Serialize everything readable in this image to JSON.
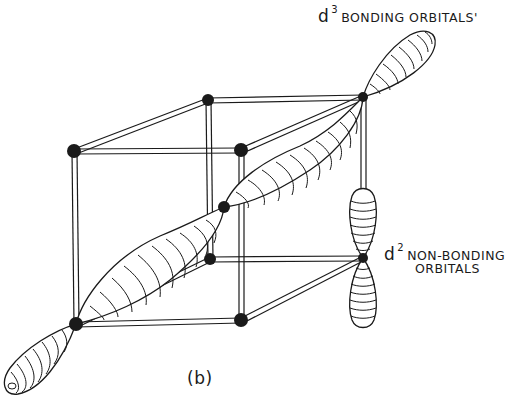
{
  "figure": {
    "panel_label": "(b)",
    "labels": {
      "bonding": {
        "prefix": "d",
        "superscript": "3",
        "text": "BONDING ORBITALS'"
      },
      "nonbonding": {
        "prefix": "d",
        "superscript": "2",
        "text_line1": "NON-BONDING",
        "text_line2": "ORBITALS"
      }
    },
    "colors": {
      "ink": "#1a1a1a",
      "background": "#ffffff"
    },
    "nodes": [
      {
        "id": "back-top-left",
        "x": 208,
        "y": 100
      },
      {
        "id": "back-top-right",
        "x": 363,
        "y": 97
      },
      {
        "id": "front-top-left",
        "x": 74,
        "y": 151
      },
      {
        "id": "front-top-right",
        "x": 241,
        "y": 150
      },
      {
        "id": "back-bottom-left",
        "x": 210,
        "y": 259
      },
      {
        "id": "back-bottom-right",
        "x": 363,
        "y": 258
      },
      {
        "id": "front-bottom-left",
        "x": 76,
        "y": 324
      },
      {
        "id": "front-bottom-right",
        "x": 241,
        "y": 320
      },
      {
        "id": "body-center",
        "x": 224,
        "y": 207
      }
    ]
  }
}
